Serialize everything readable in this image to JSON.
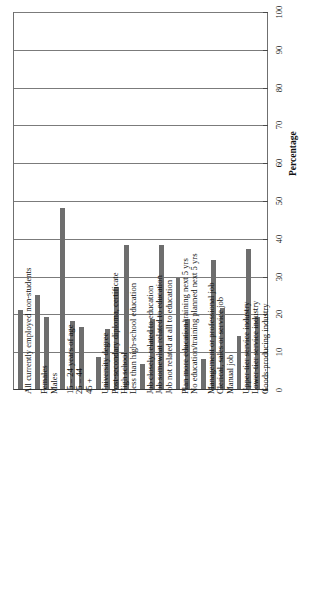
{
  "chart_data": {
    "type": "bar",
    "title": "",
    "subtitle": "",
    "orientation": "vertical-bars-rotated-labels",
    "xlabel": "",
    "ylabel": "Percentage",
    "ylim": [
      0,
      100
    ],
    "ytick_labels": [
      "0",
      "10",
      "20",
      "30",
      "40",
      "50",
      "60",
      "70",
      "80",
      "90",
      "100"
    ],
    "ytick_values": [
      0,
      10,
      20,
      30,
      40,
      50,
      60,
      70,
      80,
      90,
      100
    ],
    "grid": true,
    "legend": null,
    "bar_color": "#6e6e6e",
    "categories": [
      "All currently employed non-students",
      "Females",
      "Males",
      "15 – 24 years of age",
      "25 – 44",
      "45 +",
      "University degree",
      "Post-secondary diploma, certificate",
      "High school",
      "Less than high-school education",
      "Job closely related to education",
      "Job somewhat related to education",
      "Job not related at all to education",
      "Plan more education/training next 5 yrs",
      "No education/training planned next 5 yrs",
      "Management or professional job",
      "Clerical, sales or service job",
      "Manual job",
      "Upper-tier service industry",
      "Lower-tier service industry",
      "Goods-producing industry"
    ],
    "values": [
      21,
      25,
      19,
      48,
      18,
      16.5,
      8.5,
      16,
      27,
      38,
      6.5,
      18.5,
      38,
      29.5,
      18.5,
      8,
      34,
      21.5,
      14,
      37,
      19
    ],
    "groups": [
      {
        "name": "Total",
        "categories": [
          "All currently employed non-students"
        ]
      },
      {
        "name": "Sex",
        "categories": [
          "Females",
          "Males"
        ]
      },
      {
        "name": "Age",
        "categories": [
          "15 – 24 years of age",
          "25 – 44",
          "45 +"
        ]
      },
      {
        "name": "Education",
        "categories": [
          "University degree",
          "Post-secondary diploma, certificate",
          "High school",
          "Less than high-school education"
        ]
      },
      {
        "name": "Job–education match",
        "categories": [
          "Job closely related to education",
          "Job somewhat related to education",
          "Job not related at all to education"
        ]
      },
      {
        "name": "Training plans",
        "categories": [
          "Plan more education/training next 5 yrs",
          "No education/training planned next 5 yrs"
        ]
      },
      {
        "name": "Occupation",
        "categories": [
          "Management or professional job",
          "Clerical, sales or service job",
          "Manual job"
        ]
      },
      {
        "name": "Industry",
        "categories": [
          "Upper-tier service industry",
          "Lower-tier service industry",
          "Goods-producing industry"
        ]
      }
    ]
  }
}
